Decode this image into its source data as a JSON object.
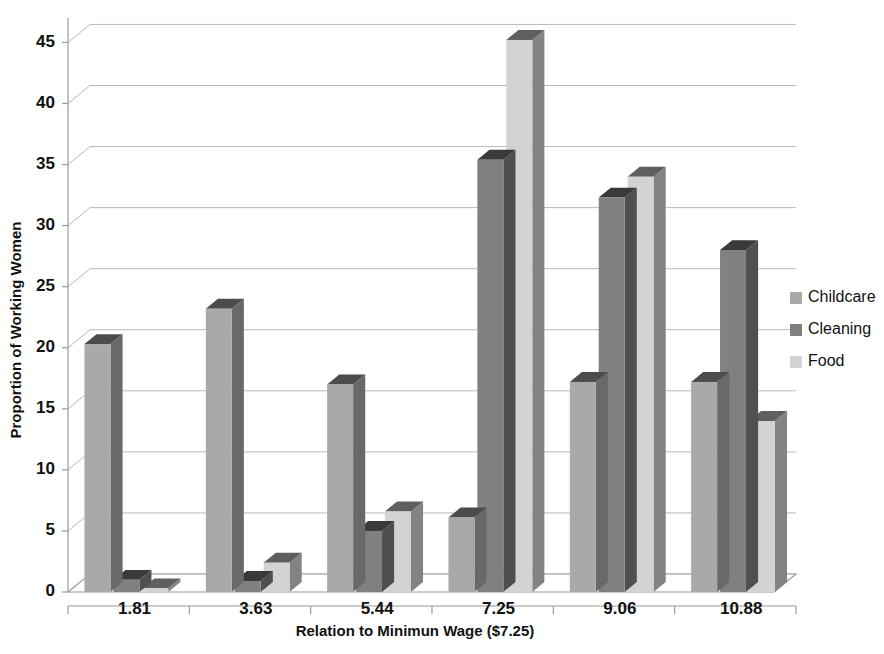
{
  "chart_data": {
    "type": "bar",
    "title": "",
    "xlabel": "Relation to Minimun Wage ($7.25)",
    "ylabel": "Proportion of Working Women",
    "categories": [
      "1.81",
      "3.63",
      "5.44",
      "7.25",
      "9.06",
      "10.88"
    ],
    "series": [
      {
        "name": "Childcare",
        "color": "#a9a9a9",
        "values": [
          20.3,
          23.2,
          17.0,
          6.1,
          17.2,
          17.2
        ]
      },
      {
        "name": "Cleaning",
        "color": "#808080",
        "values": [
          1.0,
          0.9,
          5.0,
          35.4,
          32.3,
          28.0
        ]
      },
      {
        "name": "Food",
        "color": "#d3d3d3",
        "values": [
          0.3,
          2.4,
          6.6,
          45.2,
          34.0,
          14.0
        ]
      }
    ],
    "ylim": [
      0,
      47
    ],
    "yticks": [
      0,
      5,
      10,
      15,
      20,
      25,
      30,
      35,
      40,
      45
    ],
    "ytick_labels": [
      "0",
      "5",
      "10",
      "15",
      "20",
      "25",
      "30",
      "35",
      "40",
      "45"
    ],
    "grid": true,
    "legend_position": "right",
    "style": "3d-column",
    "colors": {
      "childcare": "#a9a9a9",
      "cleaning": "#808080",
      "food": "#d3d3d3",
      "gridline": "#b9b9b9",
      "axis": "#9a9a9a",
      "text": "#111111",
      "background": "#ffffff"
    }
  },
  "legend": {
    "items": [
      {
        "label": "Childcare",
        "color": "#a9a9a9"
      },
      {
        "label": "Cleaning",
        "color": "#808080"
      },
      {
        "label": "Food",
        "color": "#d3d3d3"
      }
    ]
  }
}
